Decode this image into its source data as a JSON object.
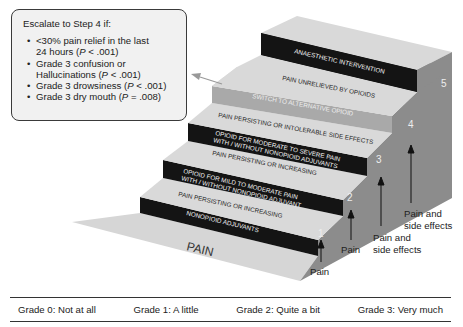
{
  "callout": {
    "title": "Escalate to Step 4 if:",
    "items": [
      {
        "line1": "<30% pain relief in the last",
        "line2_pre": "24 hours (",
        "p": "P",
        "line2_post": " < .001)"
      },
      {
        "line1": "Grade 3 confusion or",
        "line2_pre": "Hallucinations (",
        "p": "P",
        "line2_post": " < .001)"
      },
      {
        "line1": "",
        "line2_pre": "Grade 3 drowsiness (",
        "p": "P",
        "line2_post": " < .001)"
      },
      {
        "line1": "",
        "line2_pre": "Grade 3 dry mouth (",
        "p": "P",
        "line2_post": " = .008)"
      }
    ]
  },
  "staircase": {
    "floor_label": "PAIN",
    "steps": [
      {
        "number": "1",
        "riser": [
          "NONOPIOID ADJUVANTS"
        ],
        "tread": [
          "PAIN PERSISTING OR INCREASING"
        ],
        "arrow_label": [
          "Pain"
        ]
      },
      {
        "number": "2",
        "riser": [
          "OPIOID FOR MILD TO MODERATE PAIN",
          "WITH / WITHOUT NONOPIOID ADJUVANT"
        ],
        "tread": [
          "PAIN PERSISTING OR INCREASING"
        ],
        "arrow_label": [
          "Pain"
        ]
      },
      {
        "number": "3",
        "riser": [
          "OPIOID FOR MODERATE TO SEVERE PAIN",
          "WITH / WITHOUT NONOPIOID ADJUVANTS"
        ],
        "tread": [
          "PAIN PERSISTING OR INTOLERABLE SIDE EFFECTS"
        ],
        "arrow_label": [
          "Pain and",
          "side effects"
        ]
      },
      {
        "number": "4",
        "riser": [
          "SWITCH TO ALTERNATIVE OPIOID"
        ],
        "tread": [
          "PAIN UNRELIEVED BY OPIOIDS"
        ],
        "arrow_label": [
          "Pain and",
          "side effects"
        ]
      },
      {
        "number": "5",
        "riser": [
          "ANAESTHETIC INTERVENTION"
        ],
        "tread": [],
        "arrow_label": []
      }
    ],
    "colors": {
      "tread": "#d9d9d9",
      "riser_dark": "#141414",
      "riser_switch": "#a9a9a9",
      "side": "#8a8a8a",
      "floor": "#d6d6d6",
      "riser_text": "#f2f2f2",
      "tread_text": "#2a2a2a"
    }
  },
  "legend": {
    "grades": [
      "Grade 0: Not at all",
      "Grade 1: A little",
      "Grade 2: Quite a bit",
      "Grade 3: Very much"
    ]
  }
}
